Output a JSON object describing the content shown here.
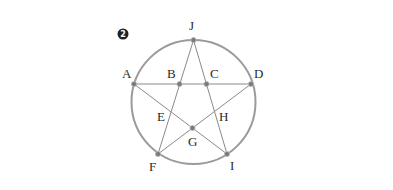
{
  "problem_number": "2",
  "colors": {
    "circle": "#9a9a9a",
    "lines": "#8a8a8a",
    "point_fill": "#7a7a7a",
    "point_stroke": "#bdbdbd",
    "label": "#2a2a2a",
    "badge": "#222222"
  },
  "circle": {
    "cx": 193.5,
    "cy": 102,
    "r": 62
  },
  "points": {
    "J": {
      "x": 193.5,
      "y": 40,
      "on_circle": true
    },
    "A": {
      "x": 134,
      "y": 84,
      "on_circle": true
    },
    "D": {
      "x": 251,
      "y": 84,
      "on_circle": true
    },
    "F": {
      "x": 158,
      "y": 154,
      "on_circle": true
    },
    "I": {
      "x": 227,
      "y": 154,
      "on_circle": true
    },
    "B": {
      "x": 179.5,
      "y": 84,
      "on_circle": false
    },
    "C": {
      "x": 206.5,
      "y": 84,
      "on_circle": false
    },
    "G": {
      "x": 192.5,
      "y": 128,
      "on_circle": false
    },
    "E": {
      "x": 170,
      "y": 111,
      "on_circle": false
    },
    "H": {
      "x": 215,
      "y": 111,
      "on_circle": false
    }
  },
  "segments": [
    [
      "J",
      "F"
    ],
    [
      "J",
      "I"
    ],
    [
      "A",
      "D"
    ],
    [
      "A",
      "I"
    ],
    [
      "D",
      "F"
    ]
  ],
  "dotted_points": [
    "J",
    "A",
    "B",
    "C",
    "D",
    "G",
    "F",
    "I"
  ],
  "labels": {
    "J": {
      "text": "J",
      "x": 189,
      "y": 30
    },
    "A": {
      "text": "A",
      "x": 122,
      "y": 78
    },
    "B": {
      "text": "B",
      "x": 167,
      "y": 78
    },
    "C": {
      "text": "C",
      "x": 210,
      "y": 78
    },
    "D": {
      "text": "D",
      "x": 254,
      "y": 78
    },
    "E": {
      "text": "E",
      "x": 157,
      "y": 121
    },
    "H": {
      "text": "H",
      "x": 219,
      "y": 121
    },
    "G": {
      "text": "G",
      "x": 188,
      "y": 146
    },
    "F": {
      "text": "F",
      "x": 149,
      "y": 171
    },
    "I": {
      "text": "I",
      "x": 230,
      "y": 170
    }
  }
}
